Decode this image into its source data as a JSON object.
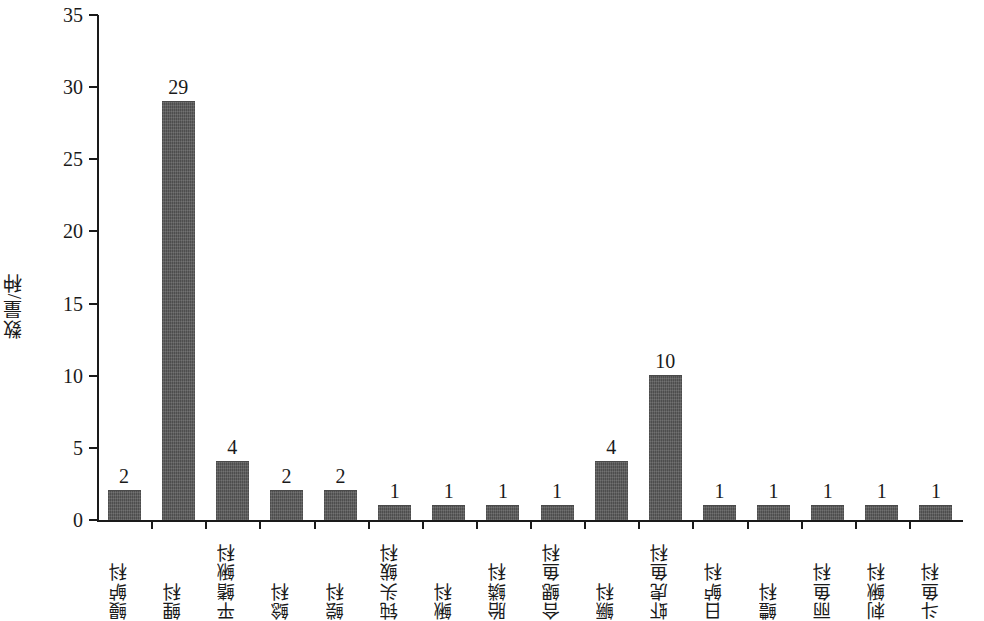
{
  "chart_data": {
    "type": "bar",
    "title": "",
    "subtitle": "",
    "xlabel": "",
    "ylabel": "数量/种",
    "ylim": [
      0,
      35
    ],
    "yticks": [
      0,
      5,
      10,
      15,
      20,
      25,
      30,
      35
    ],
    "grid": false,
    "legend": false,
    "bar_color": "#585858",
    "axis_color": "#1a1a1a",
    "categories": [
      "鳗鲈科",
      "鲤科",
      "平鳍鳅科",
      "鲶科",
      "鲿科",
      "钝头鲅科",
      "鳅科",
      "胎鳞科",
      "合鳃鱼科",
      "鳜科",
      "虾虎鱼科",
      "日鲈科",
      "鳢科",
      "丽鱼科",
      "刺鳅科",
      "斗鱼科"
    ],
    "values": [
      2,
      29,
      4,
      2,
      2,
      1,
      1,
      1,
      1,
      4,
      10,
      1,
      1,
      1,
      1,
      1
    ],
    "value_labels": [
      "2",
      "29",
      "4",
      "2",
      "2",
      "1",
      "1",
      "1",
      "1",
      "4",
      "10",
      "1",
      "1",
      "1",
      "1",
      "1"
    ],
    "ytick_labels": [
      "0",
      "5",
      "10",
      "15",
      "20",
      "25",
      "30",
      "35"
    ]
  }
}
